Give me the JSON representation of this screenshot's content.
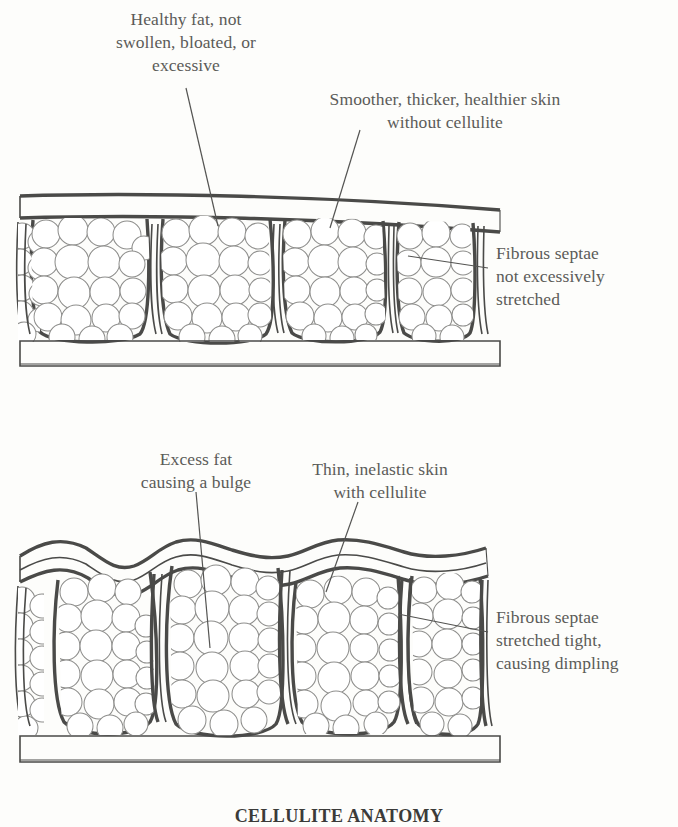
{
  "figure": {
    "caption": "CELLULITE ANATOMY",
    "ink_color": "#5b5b58",
    "line_color": "#4a4a48",
    "background": "#fdfdfb"
  },
  "panels": [
    {
      "id": "healthy",
      "name": "healthy-skin-panel",
      "labels": [
        {
          "id": "healthy-fat",
          "text": "Healthy fat, not\nswollen, bloated, or\nexcessive"
        },
        {
          "id": "smooth-skin",
          "text": "Smoother, thicker, healthier skin\nwithout cellulite"
        },
        {
          "id": "septae-ok",
          "text": "Fibrous septae\nnot excessively\nstretched"
        }
      ],
      "features": {
        "skin_surface": "flat",
        "skin_layer": "thick even band",
        "fat_chambers": 5,
        "septae": "short, vertical, not stretched",
        "muscle_layer": "flat outlined band"
      }
    },
    {
      "id": "cellulite",
      "name": "cellulite-skin-panel",
      "labels": [
        {
          "id": "excess-fat",
          "text": "Excess fat\ncausing a bulge"
        },
        {
          "id": "thin-skin",
          "text": "Thin, inelastic skin\nwith cellulite"
        },
        {
          "id": "septae-tight",
          "text": "Fibrous septae\nstretched tight,\ncausing dimpling"
        }
      ],
      "features": {
        "skin_surface": "wavy with dimples",
        "skin_layer": "thin uneven band",
        "fat_chambers": 5,
        "septae": "long, stretched tight, pulling skin down",
        "muscle_layer": "flat outlined band"
      }
    }
  ]
}
